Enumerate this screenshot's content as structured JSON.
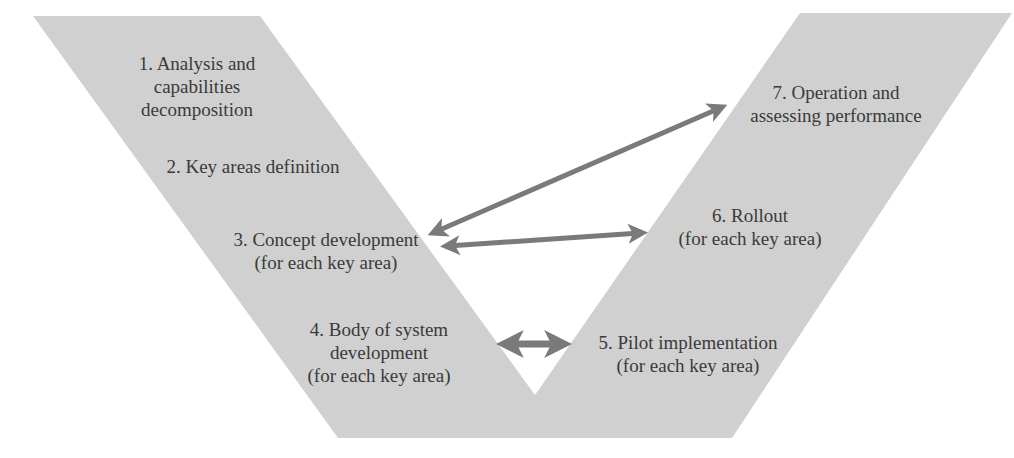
{
  "diagram": {
    "type": "V-model process",
    "colors": {
      "background": "#ffffff",
      "v_fill": "#d0d0d0",
      "arrow": "#7a7a7a",
      "text": "#3a3a3a"
    },
    "shape": {
      "left_arm": [
        [
          33,
          16
        ],
        [
          260,
          16
        ],
        [
          535,
          395
        ],
        [
          535,
          438
        ],
        [
          338,
          438
        ]
      ],
      "right_arm": [
        [
          800,
          13
        ],
        [
          1012,
          13
        ],
        [
          732,
          438
        ],
        [
          535,
          438
        ],
        [
          535,
          395
        ]
      ]
    },
    "steps": [
      {
        "id": 1,
        "lines": [
          "1. Analysis and",
          "capabilities",
          "decomposition"
        ],
        "x": 197,
        "y": 52
      },
      {
        "id": 2,
        "lines": [
          "2. Key areas definition"
        ],
        "x": 253,
        "y": 155
      },
      {
        "id": 3,
        "lines": [
          "3. Concept development",
          "(for each key area)"
        ],
        "x": 326,
        "y": 228
      },
      {
        "id": 4,
        "lines": [
          "4. Body of system",
          "development",
          "(for each key area)"
        ],
        "x": 379,
        "y": 318
      },
      {
        "id": 5,
        "lines": [
          "5. Pilot implementation",
          "(for each key area)"
        ],
        "x": 688,
        "y": 331
      },
      {
        "id": 6,
        "lines": [
          "6. Rollout",
          "(for each key area)"
        ],
        "x": 750,
        "y": 204
      },
      {
        "id": 7,
        "lines": [
          "7. Operation and",
          "assessing performance"
        ],
        "x": 836,
        "y": 81
      }
    ],
    "arrows": [
      {
        "from_step": 3,
        "to_step": 7,
        "x1": 435,
        "y1": 232,
        "x2": 720,
        "y2": 108,
        "width": 5
      },
      {
        "from_step": 3,
        "to_step": 6,
        "x1": 448,
        "y1": 246,
        "x2": 640,
        "y2": 233,
        "width": 5
      },
      {
        "from_step": 4,
        "to_step": 5,
        "x1": 507,
        "y1": 344,
        "x2": 561,
        "y2": 344,
        "width": 7
      }
    ]
  }
}
